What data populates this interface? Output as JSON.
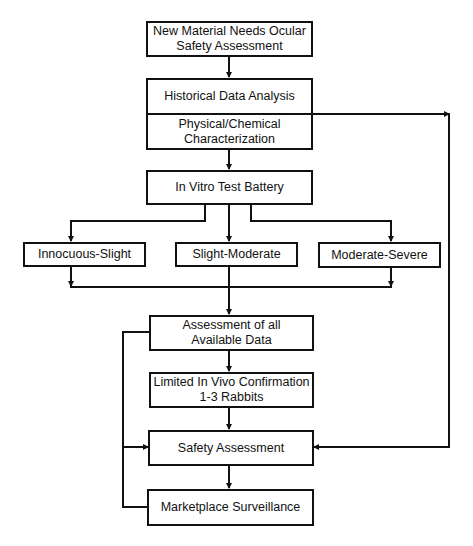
{
  "diagram": {
    "type": "flowchart",
    "nodes": [
      {
        "id": "new_material",
        "lines": [
          "New Material Needs Ocular",
          "Safety Assessment"
        ]
      },
      {
        "id": "historical",
        "lines": [
          "Historical Data Analysis"
        ]
      },
      {
        "id": "physchem",
        "lines": [
          "Physical/Chemical",
          "Characterization"
        ]
      },
      {
        "id": "invitro",
        "lines": [
          "In Vitro Test Battery"
        ]
      },
      {
        "id": "innocuous",
        "lines": [
          "Innocuous-Slight"
        ]
      },
      {
        "id": "slight_mod",
        "lines": [
          "Slight-Moderate"
        ]
      },
      {
        "id": "mod_severe",
        "lines": [
          "Moderate-Severe"
        ]
      },
      {
        "id": "assessment_all",
        "lines": [
          "Assessment of all",
          "Available Data"
        ]
      },
      {
        "id": "in_vivo",
        "lines": [
          "Limited In Vivo Confirmation",
          "1-3 Rabbits"
        ]
      },
      {
        "id": "safety",
        "lines": [
          "Safety Assessment"
        ]
      },
      {
        "id": "surveillance",
        "lines": [
          "Marketplace Surveillance"
        ]
      }
    ],
    "edges": [
      {
        "from": "new_material",
        "to": "historical"
      },
      {
        "from": "physchem",
        "to": "invitro"
      },
      {
        "from": "invitro",
        "to": "innocuous"
      },
      {
        "from": "invitro",
        "to": "slight_mod"
      },
      {
        "from": "invitro",
        "to": "mod_severe"
      },
      {
        "from": "innocuous",
        "to": "assessment_all"
      },
      {
        "from": "slight_mod",
        "to": "assessment_all"
      },
      {
        "from": "mod_severe",
        "to": "assessment_all"
      },
      {
        "from": "assessment_all",
        "to": "in_vivo"
      },
      {
        "from": "in_vivo",
        "to": "safety"
      },
      {
        "from": "historical",
        "to": "safety",
        "route": "right-side"
      },
      {
        "from": "assessment_all",
        "to": "safety",
        "route": "left-side"
      },
      {
        "from": "safety",
        "to": "surveillance"
      },
      {
        "from": "surveillance",
        "to": "safety",
        "route": "left-side"
      }
    ]
  }
}
